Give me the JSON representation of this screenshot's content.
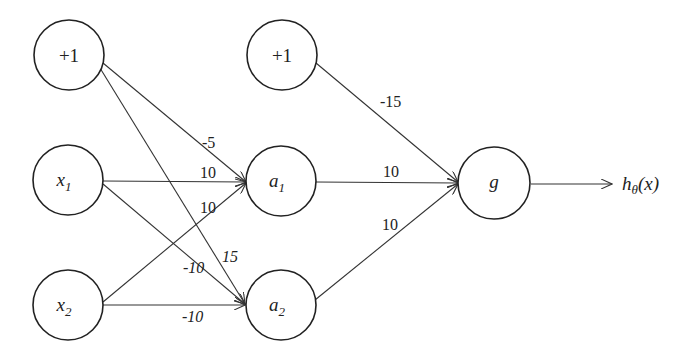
{
  "diagram": {
    "title": "",
    "type": "neural-network",
    "nodes": {
      "bias1": {
        "label": "+1",
        "layer": "input"
      },
      "x1": {
        "label": "x",
        "sub": "1",
        "layer": "input"
      },
      "x2": {
        "label": "x",
        "sub": "2",
        "layer": "input"
      },
      "bias2": {
        "label": "+1",
        "layer": "hidden"
      },
      "a1": {
        "label": "a",
        "sub": "1",
        "layer": "hidden"
      },
      "a2": {
        "label": "a",
        "sub": "2",
        "layer": "hidden"
      },
      "g": {
        "label": "g",
        "layer": "output"
      }
    },
    "edges": [
      {
        "from": "bias1",
        "to": "a1",
        "weight": "-5"
      },
      {
        "from": "x1",
        "to": "a1",
        "weight": "10"
      },
      {
        "from": "x2",
        "to": "a1",
        "weight": "10"
      },
      {
        "from": "bias1",
        "to": "a2",
        "weight": "15"
      },
      {
        "from": "x1",
        "to": "a2",
        "weight": "-10"
      },
      {
        "from": "x2",
        "to": "a2",
        "weight": "-10"
      },
      {
        "from": "bias2",
        "to": "g",
        "weight": "-15"
      },
      {
        "from": "a1",
        "to": "g",
        "weight": "10"
      },
      {
        "from": "a2",
        "to": "g",
        "weight": "10"
      }
    ],
    "output": {
      "label": "h",
      "sub": "θ",
      "suffix": "(x)"
    }
  }
}
